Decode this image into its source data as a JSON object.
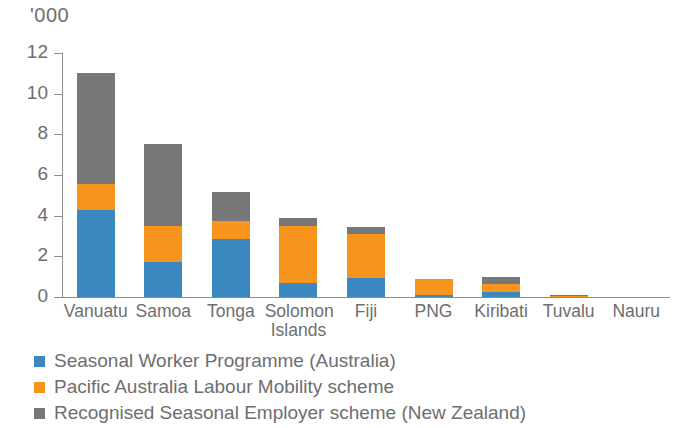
{
  "units_label": "'000",
  "colors": {
    "blue": "#3b87c0",
    "orange": "#f7941e",
    "grey": "#77777a",
    "axis": "#8c8c8e",
    "text": "#6d6e70"
  },
  "legend": {
    "items": [
      {
        "label": "Seasonal Worker Programme (Australia)",
        "color_key": "blue",
        "icon": "legend-swatch-blue"
      },
      {
        "label": "Pacific Australia Labour Mobility scheme",
        "color_key": "orange",
        "icon": "legend-swatch-orange"
      },
      {
        "label": "Recognised Seasonal Employer scheme (New Zealand)",
        "color_key": "grey",
        "icon": "legend-swatch-grey"
      }
    ]
  },
  "chart_data": {
    "type": "bar",
    "stacked": true,
    "title": "",
    "subtitle": "",
    "xlabel": "",
    "ylabel": "'000",
    "ylim": [
      0,
      12
    ],
    "yticks": [
      0,
      2,
      4,
      6,
      8,
      10,
      12
    ],
    "ytick_labels": [
      "0",
      "2",
      "4",
      "6",
      "8",
      "10",
      "12"
    ],
    "grid": false,
    "legend_position": "bottom-left",
    "categories": [
      "Vanuatu",
      "Samoa",
      "Tonga",
      "Solomon\nIslands",
      "Fiji",
      "PNG",
      "Kiribati",
      "Tuvalu",
      "Nauru"
    ],
    "series": [
      {
        "name": "Seasonal Worker Programme (Australia)",
        "color": "#3b87c0",
        "values": [
          4.3,
          1.7,
          2.85,
          0.7,
          0.95,
          0.1,
          0.25,
          0.0,
          0.0
        ]
      },
      {
        "name": "Pacific Australia Labour Mobility scheme",
        "color": "#f7941e",
        "values": [
          1.25,
          1.8,
          0.9,
          2.8,
          2.15,
          0.8,
          0.4,
          0.05,
          0.0
        ]
      },
      {
        "name": "Recognised Seasonal Employer scheme (New Zealand)",
        "color": "#77777a",
        "values": [
          5.45,
          4.05,
          1.4,
          0.4,
          0.35,
          0.0,
          0.35,
          0.05,
          0.0
        ]
      }
    ],
    "totals": [
      11.0,
      7.55,
      5.15,
      3.9,
      3.45,
      0.9,
      1.0,
      0.1,
      0.0
    ]
  }
}
